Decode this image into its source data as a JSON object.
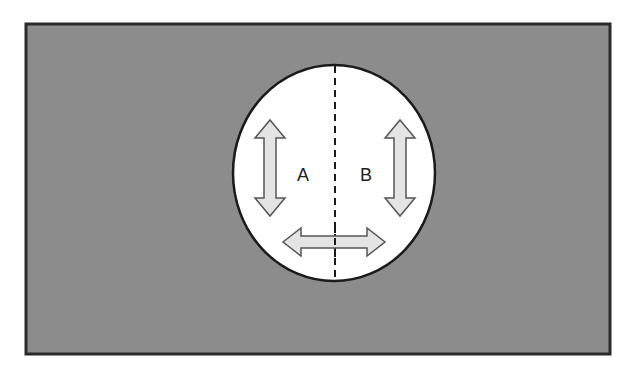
{
  "diagram": {
    "background_color": "#8c8c8c",
    "border_color": "#2a2a2a",
    "circle_fill": "#ffffff",
    "arrow_fill": "#e4e4e4",
    "arrow_stroke": "#555555",
    "regions": [
      {
        "label": "A",
        "side": "left"
      },
      {
        "label": "B",
        "side": "right"
      }
    ],
    "divider": "dashed-vertical-line",
    "arrows": [
      {
        "direction": "vertical",
        "region": "A"
      },
      {
        "direction": "vertical",
        "region": "B"
      },
      {
        "direction": "horizontal",
        "region": "across"
      }
    ]
  }
}
